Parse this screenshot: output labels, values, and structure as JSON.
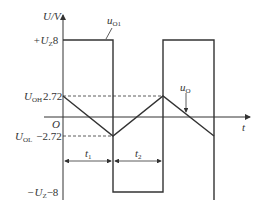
{
  "diagram": {
    "axes": {
      "y_label": "U/V",
      "x_label": "t",
      "origin_label": "O"
    },
    "levels": {
      "upper_sat": {
        "symbol": "+U",
        "sub": "Z",
        "value": "8"
      },
      "upper_thresh": {
        "symbol": "U",
        "sub": "OH",
        "value": "2.72"
      },
      "lower_thresh": {
        "symbol": "U",
        "sub": "OL",
        "value": "−2.72"
      },
      "lower_sat": {
        "symbol": "−U",
        "sub": "Z",
        "value": "−8"
      }
    },
    "waveforms": [
      {
        "name": "u",
        "sub": "O1",
        "description": "square wave between +8 V and −8 V"
      },
      {
        "name": "u",
        "sub": "O",
        "description": "triangle wave between +2.72 V and −2.72 V"
      }
    ],
    "intervals": [
      {
        "name": "t",
        "sub": "1"
      },
      {
        "name": "t",
        "sub": "2"
      }
    ],
    "colors": {
      "line": "#333333",
      "background": "#ffffff"
    }
  }
}
